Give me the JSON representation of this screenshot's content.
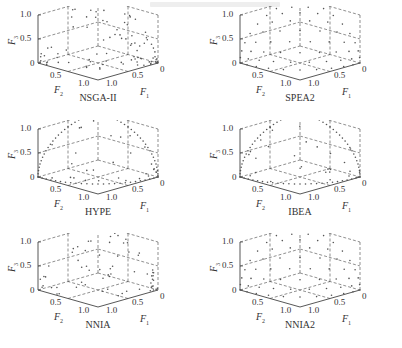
{
  "header": {
    "text": ""
  },
  "chart_data": [
    {
      "type": "scatter",
      "title": "NSGA-II",
      "xlabel": "F1",
      "ylabel": "F2",
      "zlabel": "F3",
      "pattern": "random",
      "ticks": [
        "0",
        "0.5",
        "1.0"
      ],
      "xlim": [
        0,
        1
      ],
      "ylim": [
        0,
        1
      ],
      "zlim": [
        0,
        1
      ]
    },
    {
      "type": "scatter",
      "title": "SPEA2",
      "xlabel": "F1",
      "ylabel": "F2",
      "zlabel": "F3",
      "pattern": "grid",
      "ticks": [
        "0",
        "0.5",
        "1.0"
      ],
      "xlim": [
        0,
        1
      ],
      "ylim": [
        0,
        1
      ],
      "zlim": [
        0,
        1
      ]
    },
    {
      "type": "scatter",
      "title": "HYPE",
      "xlabel": "F1",
      "ylabel": "F2",
      "zlabel": "F3",
      "pattern": "sphere-boundary",
      "ticks": [
        "0",
        "0.5",
        "1.0"
      ],
      "xlim": [
        0,
        1
      ],
      "ylim": [
        0,
        1
      ],
      "zlim": [
        0,
        1
      ]
    },
    {
      "type": "scatter",
      "title": "IBEA",
      "xlabel": "F1",
      "ylabel": "F2",
      "zlabel": "F3",
      "pattern": "sphere-boundary",
      "ticks": [
        "0",
        "0.5",
        "1.0"
      ],
      "xlim": [
        0,
        1
      ],
      "ylim": [
        0,
        1
      ],
      "zlim": [
        0,
        1
      ]
    },
    {
      "type": "scatter",
      "title": "NNIA",
      "xlabel": "F1",
      "ylabel": "F2",
      "zlabel": "F3",
      "pattern": "clustered",
      "ticks": [
        "0",
        "0.5",
        "1.0"
      ],
      "xlim": [
        0,
        1
      ],
      "ylim": [
        0,
        1
      ],
      "zlim": [
        0,
        1
      ]
    },
    {
      "type": "scatter",
      "title": "NNIA2",
      "xlabel": "F1",
      "ylabel": "F2",
      "zlabel": "F3",
      "pattern": "grid",
      "ticks": [
        "0",
        "0.5",
        "1.0"
      ],
      "xlim": [
        0,
        1
      ],
      "ylim": [
        0,
        1
      ],
      "zlim": [
        0,
        1
      ]
    }
  ],
  "panels": [
    {
      "title": "NSGA-II",
      "z_ticks": [
        "1.0",
        "0.5",
        "0"
      ],
      "f2_ticks": [
        "0.5",
        "1.0"
      ],
      "f1_ticks": [
        "0",
        "0.5",
        "1.0"
      ],
      "f3_label": "F",
      "f3_sub": "3",
      "f2_label": "F",
      "f2_sub": "2",
      "f1_label": "F",
      "f1_sub": "1"
    },
    {
      "title": "SPEA2",
      "z_ticks": [
        "1.0",
        "0.5",
        "0"
      ],
      "f2_ticks": [
        "0.5",
        "1.0"
      ],
      "f1_ticks": [
        "0",
        "0.5",
        "1.0"
      ],
      "f3_label": "F",
      "f3_sub": "3",
      "f2_label": "F",
      "f2_sub": "2",
      "f1_label": "F",
      "f1_sub": "1"
    },
    {
      "title": "HYPE",
      "z_ticks": [
        "1.0",
        "0.5",
        "0"
      ],
      "f2_ticks": [
        "0.5",
        "1.0"
      ],
      "f1_ticks": [
        "0",
        "0.5",
        "1.0"
      ],
      "f3_label": "F",
      "f3_sub": "3",
      "f2_label": "F",
      "f2_sub": "2",
      "f1_label": "F",
      "f1_sub": "1"
    },
    {
      "title": "IBEA",
      "z_ticks": [
        "1.0",
        "0.5",
        "0"
      ],
      "f2_ticks": [
        "0.5",
        "1.0"
      ],
      "f1_ticks": [
        "0",
        "0.5",
        "1.0"
      ],
      "f3_label": "F",
      "f3_sub": "3",
      "f2_label": "F",
      "f2_sub": "2",
      "f1_label": "F",
      "f1_sub": "1"
    },
    {
      "title": "NNIA",
      "z_ticks": [
        "1.0",
        "0.5",
        "0"
      ],
      "f2_ticks": [
        "0.5",
        "1.0"
      ],
      "f1_ticks": [
        "0",
        "0.5",
        "1.0"
      ],
      "f3_label": "F",
      "f3_sub": "3",
      "f2_label": "F",
      "f2_sub": "2",
      "f1_label": "F",
      "f1_sub": "1"
    },
    {
      "title": "NNIA2",
      "z_ticks": [
        "1.0",
        "0.5",
        "0"
      ],
      "f2_ticks": [
        "0.5",
        "1.0"
      ],
      "f1_ticks": [
        "0",
        "0.5",
        "1.0"
      ],
      "f3_label": "F",
      "f3_sub": "3",
      "f2_label": "F",
      "f2_sub": "2",
      "f1_label": "F",
      "f1_sub": "1"
    }
  ]
}
